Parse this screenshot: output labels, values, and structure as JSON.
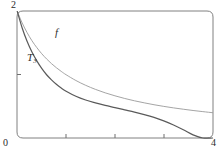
{
  "figure": {
    "name": "taylor-polynomial-approximation-plot",
    "background_color": "#ffffff",
    "frame_color": "#7a7a7a",
    "axis_color": "#6e6e6e"
  },
  "axes": {
    "x_min_label": "0",
    "x_max_label": "4",
    "y_max_label": "2",
    "x_ticks": [
      1,
      2,
      3
    ],
    "y_ticks": [
      1
    ],
    "x_range": [
      0,
      4
    ],
    "y_range": [
      0,
      2
    ],
    "grid": false
  },
  "labels": {
    "f_curve": "f",
    "t3_curve": "T",
    "t3_subscript": "3"
  },
  "chart_data": {
    "type": "line",
    "title": "",
    "xlabel": "",
    "ylabel": "",
    "xlim": [
      0,
      4
    ],
    "ylim": [
      0,
      2
    ],
    "grid": false,
    "legend_position": "inline-annotations",
    "series": [
      {
        "name": "f",
        "color": "#9a9a9a",
        "width": 0.9,
        "x": [
          0,
          0.1,
          0.2,
          0.3,
          0.4,
          0.5,
          0.6,
          0.7,
          0.8,
          0.9,
          1.0,
          1.2,
          1.4,
          1.6,
          1.8,
          2.0,
          2.2,
          2.4,
          2.6,
          2.8,
          3.0,
          3.2,
          3.4,
          3.6,
          3.8,
          4.0
        ],
        "y": [
          2.0,
          1.818,
          1.667,
          1.538,
          1.429,
          1.333,
          1.25,
          1.176,
          1.111,
          1.053,
          1.0,
          0.909,
          0.833,
          0.769,
          0.714,
          0.667,
          0.625,
          0.588,
          0.556,
          0.526,
          0.5,
          0.476,
          0.455,
          0.435,
          0.417,
          0.4
        ]
      },
      {
        "name": "T3",
        "color": "#5a5a5a",
        "width": 1.2,
        "x": [
          0,
          0.1,
          0.2,
          0.3,
          0.4,
          0.5,
          0.6,
          0.7,
          0.8,
          0.9,
          1.0,
          1.2,
          1.4,
          1.6,
          1.8,
          2.0,
          2.2,
          2.4,
          2.6,
          2.8,
          3.0,
          3.2,
          3.4,
          3.6,
          3.8,
          4.0
        ],
        "y": [
          2.0,
          1.74,
          1.53,
          1.36,
          1.22,
          1.1,
          1.0,
          0.92,
          0.85,
          0.79,
          0.74,
          0.66,
          0.6,
          0.555,
          0.515,
          0.48,
          0.445,
          0.41,
          0.37,
          0.325,
          0.27,
          0.205,
          0.13,
          0.05,
          0.0,
          0.0
        ]
      }
    ]
  }
}
